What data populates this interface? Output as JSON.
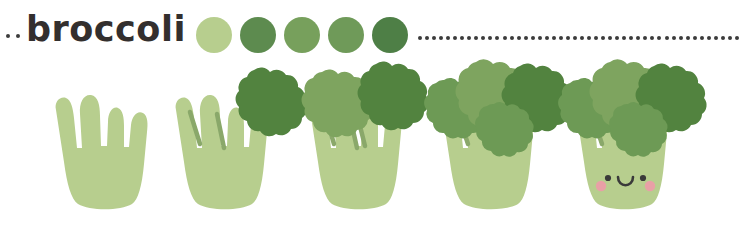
{
  "header": {
    "title": "broccoli",
    "leading_dots": 2,
    "dotted_rule_dots": 46,
    "dot_color": "#3b3b3b",
    "title_color": "#332f2e"
  },
  "palette": {
    "label": "color-swatches",
    "swatches": [
      {
        "name": "light-green",
        "hex": "#b7ce8e"
      },
      {
        "name": "dark-green",
        "hex": "#5d8b4f"
      },
      {
        "name": "medium-green",
        "hex": "#77a05c"
      },
      {
        "name": "sage-green",
        "hex": "#6f9a59"
      },
      {
        "name": "deep-green",
        "hex": "#4e7f46"
      }
    ]
  },
  "colors": {
    "stalk": "#b7ce8e",
    "stalk_line": "#8aa86a",
    "floret_light": "#7ea45f",
    "floret_mid": "#6d9a55",
    "floret_dark": "#52833f",
    "face": "#3a3a3a",
    "cheek": "#e8a0a6",
    "background": "#ffffff"
  },
  "tutorial": {
    "subject": "broccoli",
    "style": "kawaii-step-by-step",
    "total_steps": 5,
    "steps": [
      {
        "index": 1,
        "name": "step-1-stalk",
        "caption": "stalk base with four prongs",
        "florets": 0,
        "stem_lines": 0,
        "face": false
      },
      {
        "index": 2,
        "name": "step-2-first-floret",
        "caption": "add first dark floret at right",
        "florets": 1,
        "stem_lines": 2,
        "face": false
      },
      {
        "index": 3,
        "name": "step-3-second-floret",
        "caption": "add second floret at top left",
        "florets": 2,
        "stem_lines": 3,
        "face": false
      },
      {
        "index": 4,
        "name": "step-4-fill-florets",
        "caption": "fill in remaining florets",
        "florets": 4,
        "stem_lines": 3,
        "face": false
      },
      {
        "index": 5,
        "name": "step-5-add-face",
        "caption": "add kawaii face with blush",
        "florets": 4,
        "stem_lines": 3,
        "face": true
      }
    ]
  },
  "face": {
    "eyes": 2,
    "mouth": "smile",
    "cheeks": 2
  }
}
